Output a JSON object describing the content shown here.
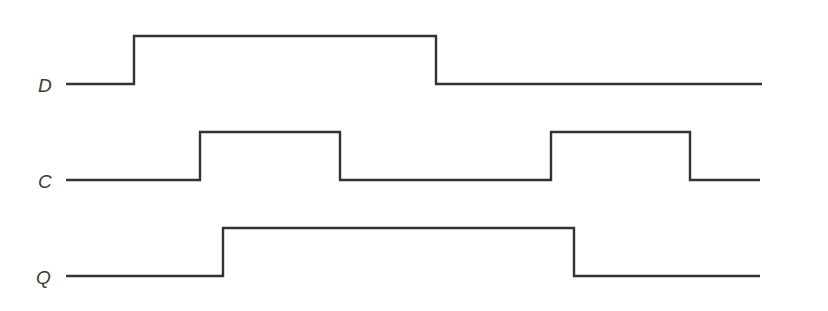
{
  "diagram": {
    "type": "timing-diagram",
    "colors": {
      "stroke": "#333333",
      "label": "#3a3a3a",
      "background": "#ffffff"
    },
    "x_start": 66,
    "signals": [
      {
        "name": "D",
        "label": "D",
        "label_x": 38,
        "label_y": 92,
        "high_y": 36,
        "low_y": 84,
        "points": [
          [
            66,
            84
          ],
          [
            134,
            84
          ],
          [
            134,
            36
          ],
          [
            436,
            36
          ],
          [
            436,
            84
          ],
          [
            762,
            84
          ]
        ]
      },
      {
        "name": "C",
        "label": "C",
        "label_x": 38,
        "label_y": 188,
        "high_y": 132,
        "low_y": 180,
        "points": [
          [
            66,
            180
          ],
          [
            200,
            180
          ],
          [
            200,
            132
          ],
          [
            340,
            132
          ],
          [
            340,
            180
          ],
          [
            551,
            180
          ],
          [
            551,
            132
          ],
          [
            690,
            132
          ],
          [
            690,
            180
          ],
          [
            760,
            180
          ]
        ]
      },
      {
        "name": "Q",
        "label": "Q",
        "label_x": 36,
        "label_y": 284,
        "high_y": 228,
        "low_y": 276,
        "points": [
          [
            66,
            276
          ],
          [
            223,
            276
          ],
          [
            223,
            228
          ],
          [
            574,
            228
          ],
          [
            574,
            276
          ],
          [
            760,
            276
          ]
        ]
      }
    ],
    "bottom_rule": {
      "x1": 140,
      "x2": 813,
      "y": 310
    }
  }
}
